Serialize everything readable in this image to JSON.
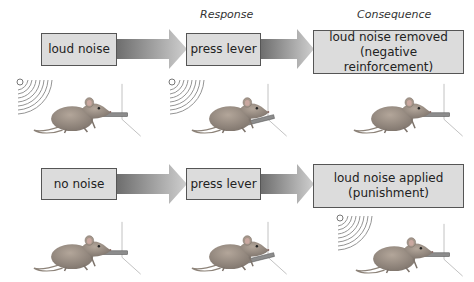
{
  "headers": {
    "response": "Response",
    "consequence": "Consequence"
  },
  "rows": [
    {
      "stimulus": "loud noise",
      "response": "press lever",
      "consequence_line1": "loud noise removed",
      "consequence_line2": "(negative reinforcement)",
      "scenes": [
        {
          "noise": true,
          "lever": "up"
        },
        {
          "noise": true,
          "lever": "pressed"
        },
        {
          "noise": false,
          "lever": "up"
        }
      ]
    },
    {
      "stimulus": "no noise",
      "response": "press lever",
      "consequence_line1": "loud noise applied",
      "consequence_line2": "(punishment)",
      "scenes": [
        {
          "noise": false,
          "lever": "up"
        },
        {
          "noise": false,
          "lever": "pressed"
        },
        {
          "noise": true,
          "lever": "up"
        }
      ]
    }
  ],
  "colors": {
    "box_fill": "#dcdcdc",
    "box_border": "#555555",
    "arrow_dark": "#7a7a7a",
    "arrow_light": "#c8c8c8"
  }
}
